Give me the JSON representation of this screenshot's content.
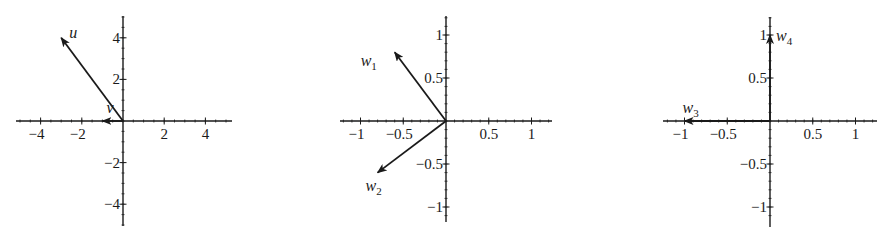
{
  "chart_data": [
    {
      "type": "vector",
      "title": "",
      "xlabel": "",
      "ylabel": "",
      "xlim": [
        -5.2,
        5.2
      ],
      "ylim": [
        -5,
        5
      ],
      "grid": false,
      "legend": "none",
      "x_ticks": [
        -4,
        -2,
        2,
        4
      ],
      "y_ticks": [
        4,
        2,
        -2,
        -4
      ],
      "x_tick_labels": [
        "−4",
        "−2",
        "2",
        "4"
      ],
      "y_tick_labels": [
        "4",
        "2",
        "−2",
        "−4"
      ],
      "minor_tick_step": 0.5,
      "vectors": [
        {
          "name": "u",
          "subscript": "",
          "x": -3,
          "y": 4
        },
        {
          "name": "v",
          "subscript": "",
          "x": -1,
          "y": 0
        }
      ]
    },
    {
      "type": "vector",
      "title": "",
      "xlabel": "",
      "ylabel": "",
      "xlim": [
        -1.25,
        1.25
      ],
      "ylim": [
        -1.2,
        1.2
      ],
      "grid": false,
      "legend": "none",
      "x_ticks": [
        -1,
        -0.5,
        0.5,
        1
      ],
      "y_ticks": [
        1,
        0.5,
        -0.5,
        -1
      ],
      "x_tick_labels": [
        "−1",
        "−0.5",
        "0.5",
        "1"
      ],
      "y_tick_labels": [
        "1",
        "0.5",
        "−0.5",
        "−1"
      ],
      "minor_tick_step": 0.1,
      "vectors": [
        {
          "name": "w",
          "subscript": "1",
          "x": -0.6,
          "y": 0.8
        },
        {
          "name": "w",
          "subscript": "2",
          "x": -0.8,
          "y": -0.6
        }
      ]
    },
    {
      "type": "vector",
      "title": "",
      "xlabel": "",
      "ylabel": "",
      "xlim": [
        -1.25,
        1.25
      ],
      "ylim": [
        -1.2,
        1.2
      ],
      "grid": false,
      "legend": "none",
      "x_ticks": [
        -1,
        -0.5,
        0.5,
        1
      ],
      "y_ticks": [
        1,
        0.5,
        -0.5,
        -1
      ],
      "x_tick_labels": [
        "−1",
        "−0.5",
        "0.5",
        "1"
      ],
      "y_tick_labels": [
        "1",
        "0.5",
        "−0.5",
        "−1"
      ],
      "minor_tick_step": 0.1,
      "vectors": [
        {
          "name": "w",
          "subscript": "3",
          "x": -1,
          "y": 0
        },
        {
          "name": "w",
          "subscript": "4",
          "x": 0,
          "y": 1
        }
      ]
    }
  ],
  "colors": {
    "axis": "#1a1a1a",
    "vector": "#1a1a1a",
    "background": "#ffffff"
  }
}
